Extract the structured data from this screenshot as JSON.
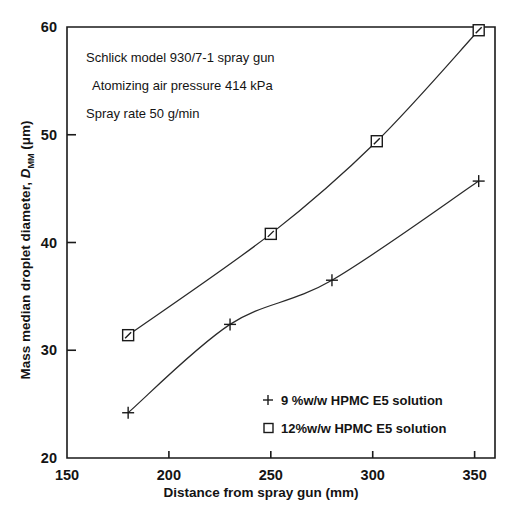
{
  "chart_data": {
    "type": "line",
    "title": "",
    "subtitle": "",
    "xlabel": "Distance from spray gun (mm)",
    "ylabel": "Mass median droplet diameter, D_MM (μm)",
    "ylabel_parts": {
      "main": "Mass median droplet diameter, ",
      "symbol_italic": "D",
      "symbol_sub": "MM",
      "units": " (μm)"
    },
    "xlim": [
      150,
      360
    ],
    "ylim": [
      20,
      60
    ],
    "xticks": [
      150,
      200,
      250,
      300,
      350
    ],
    "xticklabels": [
      "150",
      "200",
      "250",
      "300",
      "350"
    ],
    "yticks": [
      20,
      30,
      40,
      50,
      60
    ],
    "yticklabels": [
      "20",
      "30",
      "40",
      "50",
      "60"
    ],
    "grid": false,
    "legend_position": "lower-right-inside",
    "series": [
      {
        "name": "9 %w/w HPMC E5 solution",
        "marker": "plus",
        "x": [
          180,
          230,
          280,
          352
        ],
        "y": [
          24.2,
          32.4,
          36.5,
          45.7
        ]
      },
      {
        "name": "12%w/w HPMC E5 solution",
        "marker": "square",
        "x": [
          180,
          250,
          302,
          352
        ],
        "y": [
          31.4,
          40.8,
          49.4,
          59.7
        ]
      }
    ],
    "annotations": [
      "Schlick model 930/7-1 spray gun",
      "Atomizing air pressure 414 kPa",
      "Spray rate 50 g/min"
    ],
    "legend_entries": [
      {
        "marker": "plus",
        "label": "9 %w/w HPMC E5 solution"
      },
      {
        "marker": "square",
        "label": "12%w/w HPMC E5 solution"
      }
    ],
    "colors": {
      "axis": "#1a1a1a",
      "line": "#2a2a2a",
      "background": "#ffffff",
      "text": "#141414"
    }
  }
}
